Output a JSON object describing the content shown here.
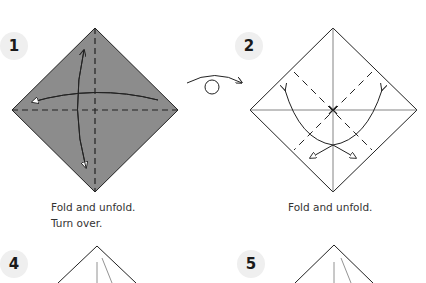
{
  "steps": [
    {
      "number": "1",
      "caption_line1": "Fold and unfold.",
      "caption_line2": "Turn over."
    },
    {
      "number": "2",
      "caption_line1": "Fold and unfold."
    },
    {
      "number": "4"
    },
    {
      "number": "5"
    }
  ],
  "icons": {
    "turn_over": "turn-over-arrow-icon"
  },
  "colors": {
    "paper_colored": "#8c8c8c",
    "paper_white": "#ffffff",
    "line": "#333333",
    "badge_bg": "#efefef"
  }
}
